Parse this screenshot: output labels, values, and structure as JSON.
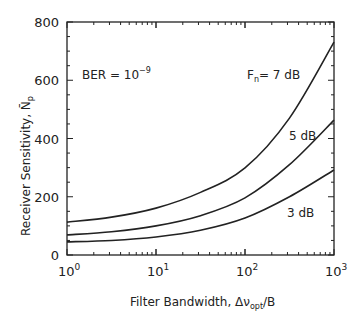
{
  "chart_data": {
    "type": "line",
    "title": "",
    "xlabel": "Filter Bandwidth, Δν_opt/B",
    "xlabel_main": "Filter Bandwidth, Δν",
    "xlabel_sub": "opt",
    "xlabel_tail": "/B",
    "ylabel": "Receiver Sensitivity, N̄p",
    "ylabel_main": "Receiver Sensitivity, N̄",
    "ylabel_sub": "p",
    "xscale": "log",
    "xlim": [
      1,
      1000
    ],
    "ylim": [
      0,
      800
    ],
    "grid": false,
    "xticks": [
      {
        "value": 1,
        "base": "10",
        "exp": "0"
      },
      {
        "value": 10,
        "base": "10",
        "exp": "1"
      },
      {
        "value": 100,
        "base": "10",
        "exp": "2"
      },
      {
        "value": 1000,
        "base": "10",
        "exp": "3"
      }
    ],
    "yticks": [
      0,
      200,
      400,
      600,
      800
    ],
    "annotation": {
      "text_main": "BER = 10",
      "text_exp": "−9"
    },
    "x": [
      1,
      3.16,
      10,
      31.6,
      100,
      316,
      1000
    ],
    "series": [
      {
        "name": "Fn = 7 dB",
        "label_main": "F",
        "label_sub": "n",
        "label_tail": "= 7 dB",
        "values": [
          113,
          130,
          161,
          215,
          299,
          470,
          731
        ]
      },
      {
        "name": "5 dB",
        "label_main": "5 dB",
        "values": [
          69,
          80,
          100,
          135,
          196,
          310,
          463
        ]
      },
      {
        "name": "3 dB",
        "label_main": "3 dB",
        "values": [
          45,
          50,
          62,
          85,
          127,
          200,
          292
        ]
      }
    ],
    "line_color": "#222222"
  }
}
